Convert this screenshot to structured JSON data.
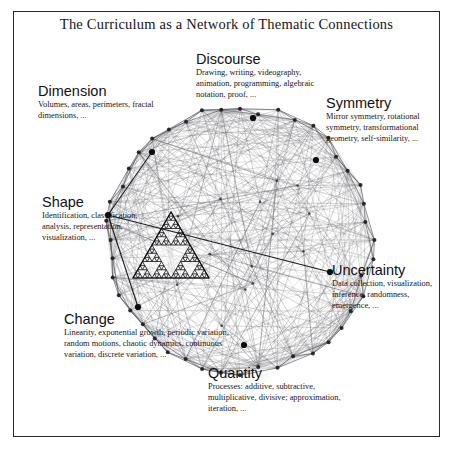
{
  "figure": {
    "title": "The Curriculum as a Network of Thematic Connections",
    "frame_color": "#2b2b2f",
    "background_color": "#ffffff"
  },
  "themes": [
    {
      "id": "discourse",
      "heading": "Discourse",
      "body": "Drawing, writing, videography, animation, programming, algebraic notation, proof, ...",
      "node": {
        "x": 253,
        "y": 118,
        "highlighted": true
      }
    },
    {
      "id": "dimension",
      "heading": "Dimension",
      "body": "Volumes, areas, perimeters, fractal dimensions, ...",
      "node": {
        "x": 152,
        "y": 152,
        "highlighted": true
      }
    },
    {
      "id": "symmetry",
      "heading": "Symmetry",
      "body": "Mirror symmetry, rotational symmetry, transformational geometry, self-similarity, ...",
      "node": {
        "x": 316,
        "y": 160,
        "highlighted": true
      }
    },
    {
      "id": "shape",
      "heading": "Shape",
      "body": "Identification, classification, analysis, representation, visualization, ...",
      "node": {
        "x": 108,
        "y": 215,
        "highlighted": true
      }
    },
    {
      "id": "uncertainty",
      "heading": "Uncertainty",
      "body": "Data collection, visualization, inference, randomness, emergence, ...",
      "node": {
        "x": 330,
        "y": 272,
        "highlighted": true
      }
    },
    {
      "id": "change",
      "heading": "Change",
      "body": "Linearity, exponential growth, periodic variation, random motions, chaotic dynamics, continuous variation, discrete variation, ...",
      "node": {
        "x": 138,
        "y": 307,
        "highlighted": true
      }
    },
    {
      "id": "quantity",
      "heading": "Quantity",
      "body": "Processes: additive, subtractive, multiplicative, divisive; approximation, iteration, ...",
      "node": {
        "x": 244,
        "y": 345,
        "highlighted": true
      }
    }
  ],
  "chart_data": {
    "type": "network-graph",
    "title": "The Curriculum as a Network of Thematic Connections",
    "layout": "circular",
    "center": {
      "x": 240,
      "y": 240
    },
    "radius": 132,
    "perimeter_node_count": 44,
    "edge_density": "near-complete graph (dense chords)",
    "node_color": "#1d1d22",
    "edge_color": "#55555c",
    "overlay": {
      "type": "sierpinski-triangle",
      "levels": 4,
      "x": 133,
      "y": 212,
      "width": 76,
      "height": 66
    },
    "highlighted_nodes": [
      "Discourse",
      "Dimension",
      "Symmetry",
      "Shape",
      "Uncertainty",
      "Change",
      "Quantity"
    ],
    "emphasis_edges": [
      [
        "Shape",
        "Uncertainty"
      ],
      [
        "Shape",
        "Change"
      ],
      [
        "Dimension",
        "Shape"
      ]
    ]
  }
}
